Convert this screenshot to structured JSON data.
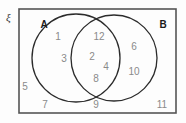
{
  "diagram": {
    "type": "venn-two-set",
    "universe_symbol": "ξ",
    "set_a_label": "A",
    "set_b_label": "B",
    "colors": {
      "rectangle_stroke": "#555555",
      "circle_stroke": "#2b2b2b",
      "element_text": "#8a8a8a",
      "set_label_text": "#1a1a1a",
      "background": "#fdfdfd"
    },
    "regions": {
      "a_only": {
        "name": "A only",
        "elements": [
          {
            "value": "1",
            "x": 58,
            "y": 40
          },
          {
            "value": "3",
            "x": 64,
            "y": 62
          }
        ]
      },
      "intersection": {
        "name": "A and B",
        "elements": [
          {
            "value": "12",
            "x": 99,
            "y": 40
          },
          {
            "value": "2",
            "x": 92,
            "y": 60
          },
          {
            "value": "4",
            "x": 106,
            "y": 70
          },
          {
            "value": "8",
            "x": 96,
            "y": 82
          }
        ]
      },
      "b_only": {
        "name": "B only",
        "elements": [
          {
            "value": "6",
            "x": 134,
            "y": 50
          },
          {
            "value": "10",
            "x": 134,
            "y": 75
          }
        ]
      },
      "outside": {
        "name": "Outside both sets",
        "elements": [
          {
            "value": "5",
            "x": 25,
            "y": 90
          },
          {
            "value": "7",
            "x": 45,
            "y": 108
          },
          {
            "value": "9",
            "x": 96,
            "y": 108
          },
          {
            "value": "11",
            "x": 162,
            "y": 108
          }
        ]
      }
    },
    "geometry": {
      "rect": {
        "x": 19,
        "y": 9,
        "width": 157,
        "height": 104
      },
      "circle_a": {
        "cx": 76,
        "cy": 58,
        "r": 44
      },
      "circle_b": {
        "cx": 114,
        "cy": 58,
        "r": 43
      },
      "label_a": {
        "x": 44,
        "y": 27
      },
      "label_b": {
        "x": 163,
        "y": 27
      },
      "label_universe": {
        "x": 6,
        "y": 20
      }
    }
  }
}
